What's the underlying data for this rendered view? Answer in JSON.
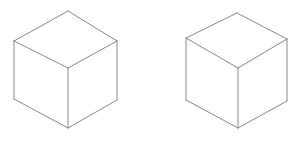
{
  "figure": {
    "background_color": "#ffffff",
    "width": 302,
    "height": 141,
    "stroke_color": "#8a8a8a",
    "face_fill": "#ffffff",
    "stroke_width": 1
  },
  "shapes": [
    {
      "name": "cube-left",
      "label": "Left cube",
      "type": "isometric-cube",
      "stroke_color": "#8a8a8a",
      "stroke_width": 1,
      "face_fill": "#ffffff",
      "vertices": {
        "top_apex": [
          68,
          11
        ],
        "top_left": [
          14,
          41
        ],
        "top_right": [
          117,
          41
        ],
        "center": [
          68,
          68
        ],
        "bottom_left": [
          14,
          99
        ],
        "bottom_right": [
          117,
          100
        ],
        "bottom_apex": [
          68,
          128
        ]
      },
      "faces": {
        "top": "68,11 14,41 68,68 117,41",
        "left": "14,41 14,99 68,128 68,68",
        "right": "117,41 117,100 68,128 68,68"
      },
      "edges": [
        "68,11 14,41",
        "68,11 117,41",
        "14,41 68,68",
        "117,41 68,68",
        "14,41 14,99",
        "117,41 117,100",
        "68,68 68,128",
        "14,99 68,128",
        "117,100 68,128"
      ]
    },
    {
      "name": "cube-right",
      "label": "Right cube",
      "type": "isometric-cube",
      "stroke_color": "#8a8a8a",
      "stroke_width": 1,
      "face_fill": "#ffffff",
      "vertices": {
        "top_apex": [
          237,
          13
        ],
        "top_left": [
          186,
          38
        ],
        "top_right": [
          287,
          39
        ],
        "center": [
          238,
          68
        ],
        "bottom_left": [
          186,
          100
        ],
        "bottom_right": [
          287,
          101
        ],
        "bottom_apex": [
          238,
          128
        ]
      },
      "faces": {
        "top": "237,13 186,38 238,68 287,39",
        "left": "186,38 186,100 238,128 238,68",
        "right": "287,39 287,101 238,128 238,68"
      },
      "edges": [
        "237,13 186,38",
        "237,13 287,39",
        "186,38 238,68",
        "287,39 238,68",
        "186,38 186,100",
        "287,39 287,101",
        "238,68 238,128",
        "186,100 238,128",
        "287,101 238,128"
      ]
    }
  ]
}
